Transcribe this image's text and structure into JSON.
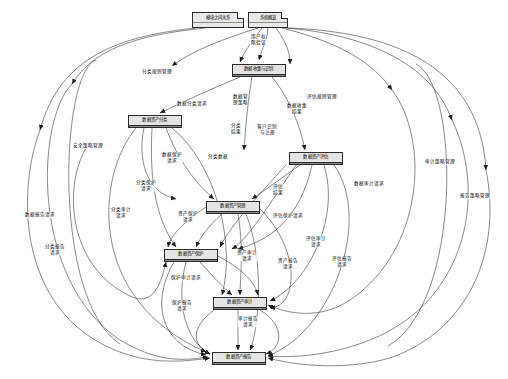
{
  "diagram": {
    "type": "data-flow-diagram",
    "language": "zh-CN",
    "background": "#ffffff",
    "stroke": "#2b2b2b",
    "node_fill": "#e9e9e9",
    "width": 508,
    "height": 379
  },
  "nodes": [
    {
      "id": "n_relation",
      "label": "模块之间关系",
      "x": 192,
      "y": 12,
      "w": 52,
      "h": 16,
      "style": "note"
    },
    {
      "id": "n_overview",
      "label": "系统概览",
      "x": 248,
      "y": 12,
      "w": 40,
      "h": 16,
      "style": "note"
    },
    {
      "id": "n_collect",
      "label": "数据收集与识别",
      "x": 232,
      "y": 64,
      "w": 54,
      "h": 13,
      "style": "node"
    },
    {
      "id": "n_classify",
      "label": "数据资产分类",
      "x": 128,
      "y": 115,
      "w": 54,
      "h": 13,
      "style": "node"
    },
    {
      "id": "n_evaluate",
      "label": "数据资产评估",
      "x": 289,
      "y": 152,
      "w": 54,
      "h": 13,
      "style": "node"
    },
    {
      "id": "n_manage",
      "label": "数据资产管理",
      "x": 206,
      "y": 201,
      "w": 54,
      "h": 13,
      "style": "node"
    },
    {
      "id": "n_protect",
      "label": "数据资产保护",
      "x": 164,
      "y": 249,
      "w": 54,
      "h": 13,
      "style": "node"
    },
    {
      "id": "n_audit",
      "label": "数据资产审计",
      "x": 213,
      "y": 297,
      "w": 54,
      "h": 13,
      "style": "node"
    },
    {
      "id": "n_report",
      "label": "数据资产报告",
      "x": 212,
      "y": 352,
      "w": 54,
      "h": 13,
      "style": "node"
    }
  ],
  "edge_labels": [
    {
      "id": "l01",
      "text": "用户权\n限验证",
      "x": 258,
      "y": 40
    },
    {
      "id": "l02",
      "text": "分类规则管理",
      "x": 157,
      "y": 72
    },
    {
      "id": "l03",
      "text": "评估规则管理",
      "x": 322,
      "y": 97
    },
    {
      "id": "l04",
      "text": "数据分类请求",
      "x": 192,
      "y": 104
    },
    {
      "id": "l05",
      "text": "数据管\n理策略",
      "x": 240,
      "y": 100
    },
    {
      "id": "l06",
      "text": "数据收集\n结果",
      "x": 297,
      "y": 109
    },
    {
      "id": "l07",
      "text": "分类\n结果",
      "x": 236,
      "y": 129
    },
    {
      "id": "l08",
      "text": "客户识别\n与注册",
      "x": 267,
      "y": 130
    },
    {
      "id": "l09",
      "text": "安全策略管理",
      "x": 88,
      "y": 146
    },
    {
      "id": "l10",
      "text": "数据保护\n请求",
      "x": 172,
      "y": 158
    },
    {
      "id": "l11",
      "text": "分类数据",
      "x": 218,
      "y": 157
    },
    {
      "id": "l12",
      "text": "审计策略管理",
      "x": 440,
      "y": 162
    },
    {
      "id": "l13",
      "text": "数据审计请求",
      "x": 369,
      "y": 184
    },
    {
      "id": "l14",
      "text": "分类保护\n请求",
      "x": 146,
      "y": 186
    },
    {
      "id": "l15",
      "text": "评估\n结果",
      "x": 278,
      "y": 190
    },
    {
      "id": "l16",
      "text": "报告策略管理",
      "x": 475,
      "y": 196
    },
    {
      "id": "l17",
      "text": "数据报告请求",
      "x": 40,
      "y": 215
    },
    {
      "id": "l18",
      "text": "分类审计\n请求",
      "x": 121,
      "y": 213
    },
    {
      "id": "l19",
      "text": "资产保护\n请求",
      "x": 188,
      "y": 217
    },
    {
      "id": "l20",
      "text": "评估保护请求",
      "x": 288,
      "y": 216
    },
    {
      "id": "l21",
      "text": "分类报告\n请求",
      "x": 55,
      "y": 250
    },
    {
      "id": "l22",
      "text": "资产审计\n请求",
      "x": 247,
      "y": 256
    },
    {
      "id": "l23",
      "text": "资产报告\n请求",
      "x": 288,
      "y": 264
    },
    {
      "id": "l24",
      "text": "评估审计\n请求",
      "x": 316,
      "y": 242
    },
    {
      "id": "l25",
      "text": "评估报告\n请求",
      "x": 342,
      "y": 262
    },
    {
      "id": "l26",
      "text": "保护审计请求",
      "x": 186,
      "y": 278
    },
    {
      "id": "l27",
      "text": "保护报告\n请求",
      "x": 182,
      "y": 306
    },
    {
      "id": "l28",
      "text": "审计报告\n请求",
      "x": 248,
      "y": 322
    }
  ]
}
